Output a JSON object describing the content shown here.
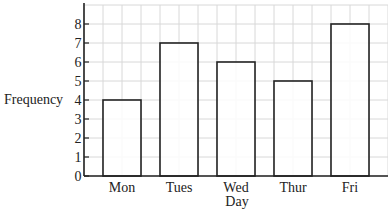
{
  "chart_data": {
    "type": "bar",
    "title": "",
    "xlabel": "Day",
    "ylabel": "Frequency",
    "categories": [
      "Mon",
      "Tues",
      "Wed",
      "Thur",
      "Fri"
    ],
    "values": [
      4,
      7,
      6,
      5,
      8
    ],
    "ylim": [
      0,
      8
    ],
    "yticks": [
      0,
      1,
      2,
      3,
      4,
      5,
      6,
      7,
      8
    ],
    "grid": true,
    "legend": null
  },
  "style": {
    "bar_fill": "#ffffff",
    "bar_stroke": "#222222",
    "grid_color": "#d8d8d8",
    "axis_color": "#222222"
  }
}
